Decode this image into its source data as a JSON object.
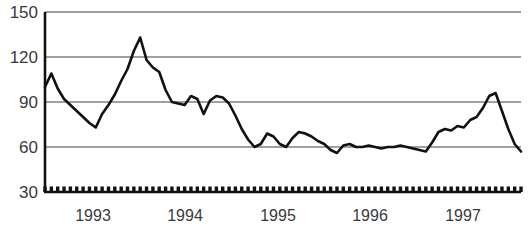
{
  "chart_data": {
    "type": "line",
    "title": "",
    "xlabel": "",
    "ylabel": "",
    "ylim": [
      30,
      150
    ],
    "yticks": [
      30,
      60,
      90,
      120,
      150
    ],
    "ytick_labels": [
      "30",
      "60",
      "90",
      "120",
      "150"
    ],
    "xtick_labels": [
      "1993",
      "1994",
      "1995",
      "1996",
      "1997"
    ],
    "grid": "horizontal",
    "legend": "none",
    "line_color": "#111111",
    "grid_color": "#808080",
    "axis_color": "#111111",
    "background_color": "#ffffff",
    "x_axis_note": "monthly tick marks along baseline, year labels centered on each year",
    "series": [
      {
        "name": "series-1",
        "values": [
          100,
          109,
          99,
          92,
          88,
          84,
          80,
          76,
          73,
          82,
          88,
          95,
          104,
          112,
          124,
          133,
          118,
          113,
          110,
          98,
          90,
          89,
          88,
          94,
          92,
          82,
          91,
          94,
          93,
          89,
          81,
          72,
          65,
          60,
          62,
          69,
          67,
          62,
          60,
          66,
          70,
          69,
          67,
          64,
          62,
          58,
          56,
          61,
          62,
          60,
          60,
          61,
          60,
          59,
          60,
          60,
          61,
          60,
          59,
          58,
          57,
          63,
          70,
          72,
          71,
          74,
          73,
          78,
          80,
          86,
          94,
          96,
          84,
          72,
          62,
          57
        ]
      }
    ]
  },
  "axis": {
    "y_labels": [
      {
        "text": "150",
        "top": 4
      },
      {
        "text": "120",
        "top": 49
      },
      {
        "text": "90",
        "top": 94
      },
      {
        "text": "60",
        "top": 139
      },
      {
        "text": "30",
        "top": 184
      }
    ],
    "x_labels": [
      {
        "text": "1993",
        "left": 63
      },
      {
        "text": "1994",
        "left": 155
      },
      {
        "text": "1995",
        "left": 248
      },
      {
        "text": "1996",
        "left": 340
      },
      {
        "text": "1997",
        "left": 433
      }
    ]
  }
}
